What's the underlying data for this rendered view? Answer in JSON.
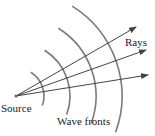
{
  "diagram": {
    "labels": {
      "source": "Source",
      "rays": "Rays",
      "wave_fronts": "Wave fronts"
    },
    "source_point": [
      16,
      96
    ],
    "rays": [
      {
        "end": [
          136,
          27
        ]
      },
      {
        "end": [
          146,
          50
        ]
      },
      {
        "end": [
          148,
          75
        ]
      }
    ],
    "wave_fronts": [
      {
        "radius": 28
      },
      {
        "radius": 54
      },
      {
        "radius": 80
      },
      {
        "radius": 106
      }
    ],
    "colors": {
      "ray": "#444444",
      "wave_front": "#7a7a7a",
      "text": "#222222"
    }
  }
}
